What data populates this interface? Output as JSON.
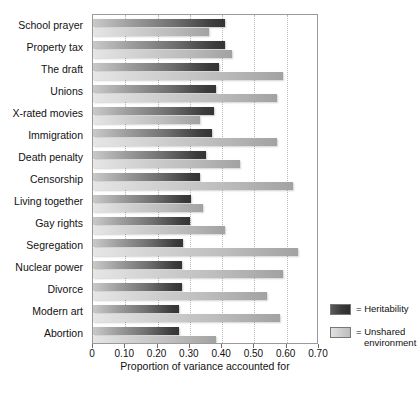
{
  "chart_data": {
    "type": "bar",
    "orientation": "horizontal",
    "title": "",
    "xlabel": "Proportion of variance accounted for",
    "ylabel": "",
    "xlim": [
      0,
      0.7
    ],
    "xticks": [
      0,
      0.1,
      0.2,
      0.3,
      0.4,
      0.5,
      0.6,
      0.7
    ],
    "xtick_labels": [
      "0",
      "0.10",
      "0.20",
      "0.30",
      "0.40",
      "0.50",
      "0.60",
      "0.70"
    ],
    "grid": "vertical-dotted",
    "legend_position": "right-bottom",
    "categories": [
      "School prayer",
      "Property tax",
      "The draft",
      "Unions",
      "X-rated movies",
      "Immigration",
      "Death penalty",
      "Censorship",
      "Living together",
      "Gay rights",
      "Segregation",
      "Nuclear power",
      "Divorce",
      "Modern art",
      "Abortion"
    ],
    "series": [
      {
        "name": "Heritability",
        "color": "#3b3b3b",
        "values": [
          0.41,
          0.41,
          0.39,
          0.38,
          0.375,
          0.37,
          0.35,
          0.33,
          0.305,
          0.3,
          0.28,
          0.275,
          0.275,
          0.265,
          0.265
        ]
      },
      {
        "name": "Unshared environment",
        "color": "#bdbdbd",
        "values": [
          0.36,
          0.43,
          0.59,
          0.57,
          0.33,
          0.57,
          0.455,
          0.62,
          0.34,
          0.41,
          0.635,
          0.59,
          0.54,
          0.58,
          0.38
        ]
      }
    ]
  },
  "legend": {
    "items": [
      {
        "prefix": "=",
        "label": "Heritability",
        "swatch": "heritability"
      },
      {
        "prefix": "=",
        "label": "Unshared environment",
        "swatch": "unshared"
      }
    ],
    "heritability_text": "= Heritability",
    "unshared_text_line1": "= Unshared",
    "unshared_text_line2": "environment"
  }
}
